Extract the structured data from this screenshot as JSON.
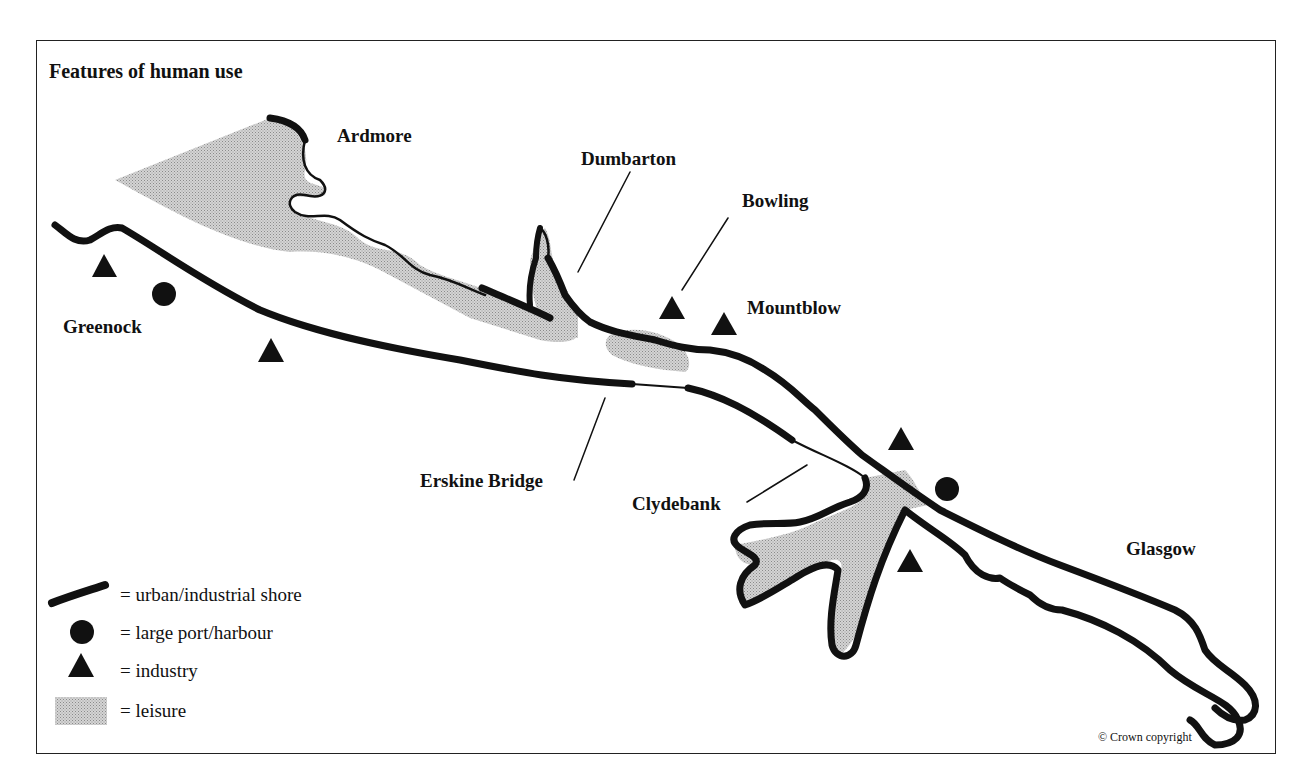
{
  "map": {
    "title": "Features of human use",
    "places": [
      {
        "id": "ardmore",
        "label": "Ardmore"
      },
      {
        "id": "dumbarton",
        "label": "Dumbarton"
      },
      {
        "id": "bowling",
        "label": "Bowling"
      },
      {
        "id": "mountblow",
        "label": "Mountblow"
      },
      {
        "id": "greenock",
        "label": "Greenock"
      },
      {
        "id": "erskine-bridge",
        "label": "Erskine Bridge"
      },
      {
        "id": "clydebank",
        "label": "Clydebank"
      },
      {
        "id": "glasgow",
        "label": "Glasgow"
      }
    ],
    "legend": [
      {
        "symbol": "thick-line-icon",
        "label": "= urban/industrial shore"
      },
      {
        "symbol": "circle-icon",
        "label": "= large port/harbour"
      },
      {
        "symbol": "triangle-icon",
        "label": "= industry"
      },
      {
        "symbol": "stipple-square-icon",
        "label": "= leisure"
      }
    ],
    "copyright": "© Crown copyright",
    "colors": {
      "ink": "#111111",
      "leisure": "#c8c8c8",
      "background": "#ffffff"
    }
  }
}
